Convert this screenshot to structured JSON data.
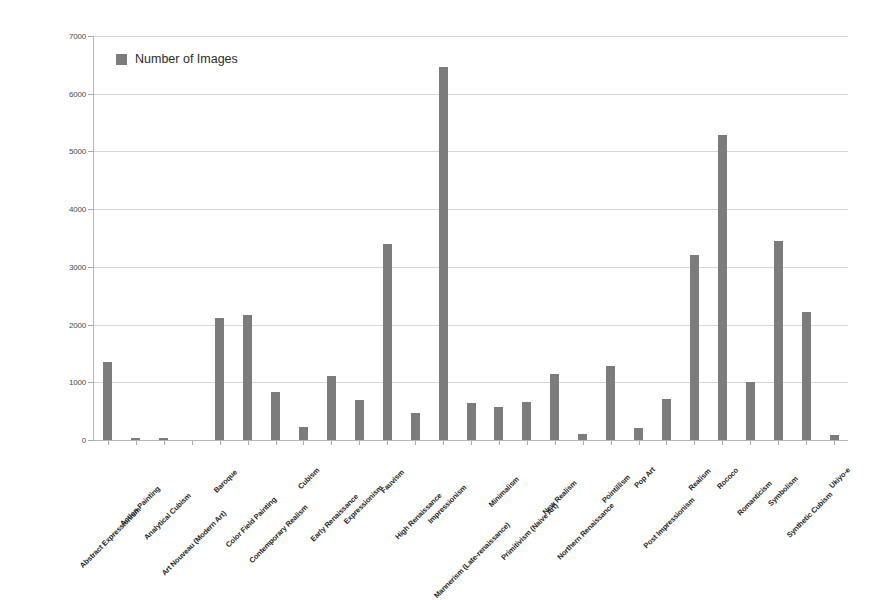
{
  "chart_data": {
    "type": "bar",
    "title": "",
    "xlabel": "",
    "ylabel": "",
    "ylim": [
      0,
      7000
    ],
    "ytick_step": 1000,
    "yticks": [
      "0",
      "1000",
      "2000",
      "3000",
      "4000",
      "5000",
      "6000",
      "7000"
    ],
    "grid": true,
    "legend_position": "inside-top-left",
    "legend": [
      "Number of Images"
    ],
    "series_color": "#7c7c7c",
    "categories": [
      "Abstract Expressionism",
      "Action Painting",
      "Analytical Cubism",
      "Art Nouveau (Modern Art)",
      "Baroque",
      "Color Field Painting",
      "Contemporary Realism",
      "Cubism",
      "Early Renaissance",
      "Expressionism",
      "Fauvism",
      "High Renaissance",
      "Impressionism",
      "Mannerism (Late-renaissance)",
      "Minimalism",
      "Primitivism (Naive Art)",
      "New Realism",
      "Northern Renaissance",
      "Pointillism",
      "Pop Art",
      "Post Impressionism",
      "Realism",
      "Rococo",
      "Romanticism",
      "Symbolism",
      "Synthetic Cubism",
      "Ukiyo-e"
    ],
    "values": [
      1350,
      35,
      35,
      0,
      2120,
      2170,
      830,
      220,
      1110,
      700,
      3400,
      460,
      6470,
      640,
      580,
      660,
      1150,
      110,
      1290,
      215,
      710,
      3200,
      5290,
      1010,
      3440,
      2220,
      80
    ],
    "legend_entry": "Number of Images"
  },
  "legend": {
    "label": "Number of Images"
  }
}
